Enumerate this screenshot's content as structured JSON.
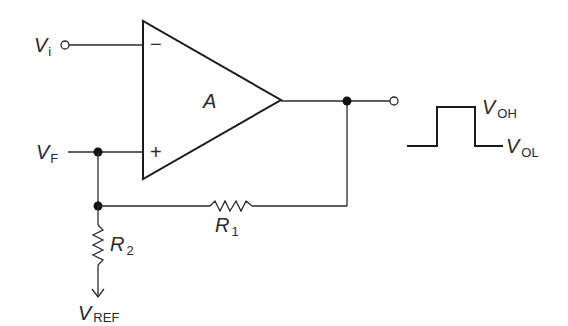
{
  "diagram": {
    "opamp": {
      "gain_label": "A",
      "inverting_sign": "−",
      "noninverting_sign": "+"
    },
    "inputs": {
      "vi": {
        "main": "V",
        "sub": "i"
      },
      "vf": {
        "main": "V",
        "sub": "F"
      }
    },
    "resistors": {
      "r1": {
        "main": "R",
        "sub": "1"
      },
      "r2": {
        "main": "R",
        "sub": "2"
      }
    },
    "reference": {
      "main": "V",
      "sub": "REF"
    },
    "output_levels": {
      "high": {
        "main": "V",
        "sub": "OH"
      },
      "low": {
        "main": "V",
        "sub": "OL"
      }
    }
  }
}
